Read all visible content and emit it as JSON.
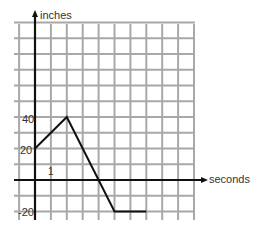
{
  "chart_data": {
    "type": "line",
    "title": "",
    "xlabel": "seconds",
    "ylabel": "inches",
    "x": [
      0,
      2,
      4,
      5,
      7
    ],
    "series": [
      {
        "name": "position",
        "values": [
          20,
          40,
          0,
          -20,
          -20
        ]
      }
    ],
    "x_ticks_labeled": [
      {
        "value": 1,
        "label": "1"
      }
    ],
    "y_ticks_labeled": [
      {
        "value": 40,
        "label": "40"
      },
      {
        "value": 20,
        "label": "20"
      },
      {
        "value": -20,
        "label": "-20"
      }
    ],
    "grid": true,
    "grid_step": {
      "x": 1,
      "y": 10
    },
    "xlim": [
      -1,
      10
    ],
    "ylim": [
      -25,
      100
    ],
    "colors": {
      "grid": "#a8a8a8",
      "axis": "#111111",
      "line": "#111111",
      "text": "#333333"
    }
  },
  "labels": {
    "x_axis": "seconds",
    "y_axis": "inches",
    "tick_x1": "1",
    "tick_y40": "40",
    "tick_y20": "20",
    "tick_yneg20": "-20"
  }
}
